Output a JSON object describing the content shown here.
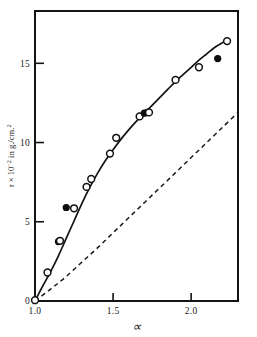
{
  "chart_data": {
    "type": "line",
    "title": "",
    "xlabel": "∝",
    "ylabel": "τ × 10⁻² in g./cm.²",
    "ylabel_parts": {
      "symbol": "τ",
      "times": "×",
      "base": "10",
      "exponent": "-2",
      "units": "in g./cm.",
      "units_exponent": "2"
    },
    "xlim": [
      1.0,
      2.3
    ],
    "ylim": [
      0,
      18.3
    ],
    "grid": false,
    "legend": "none",
    "xticks": [
      1.0,
      1.5,
      2.0
    ],
    "xticklabels": [
      "1.0",
      "1.5",
      "2.0"
    ],
    "yticks": [
      0,
      5,
      10,
      15
    ],
    "yticklabels": [
      "0",
      "5",
      "10",
      "15"
    ],
    "series": [
      {
        "name": "experimental-curve",
        "style": "solid",
        "x": [
          1.0,
          1.05,
          1.1,
          1.15,
          1.2,
          1.25,
          1.3,
          1.35,
          1.4,
          1.45,
          1.5,
          1.55,
          1.6,
          1.65,
          1.7,
          1.75,
          1.8,
          1.85,
          1.9,
          1.95,
          2.0,
          2.05,
          2.1,
          2.15,
          2.2,
          2.23
        ],
        "y": [
          0.0,
          0.95,
          1.85,
          2.85,
          3.95,
          5.05,
          6.15,
          7.15,
          8.05,
          8.85,
          9.55,
          10.2,
          10.8,
          11.35,
          11.85,
          12.35,
          12.85,
          13.35,
          13.85,
          14.3,
          14.75,
          15.2,
          15.6,
          16.0,
          16.3,
          16.45
        ]
      },
      {
        "name": "theoretical-curve",
        "style": "dashed",
        "x": [
          1.0,
          1.1,
          1.2,
          1.3,
          1.4,
          1.5,
          1.6,
          1.7,
          1.8,
          1.9,
          2.0,
          2.1,
          2.2,
          2.3
        ],
        "y": [
          0.0,
          0.75,
          1.55,
          2.45,
          3.35,
          4.3,
          5.25,
          6.2,
          7.15,
          8.1,
          9.05,
          10.0,
          10.95,
          11.9
        ]
      }
    ],
    "points": [
      {
        "x": 1.0,
        "y": 0.05,
        "marker": "open"
      },
      {
        "x": 1.08,
        "y": 1.8,
        "marker": "open"
      },
      {
        "x": 1.15,
        "y": 3.75,
        "marker": "filled"
      },
      {
        "x": 1.16,
        "y": 3.8,
        "marker": "open"
      },
      {
        "x": 1.2,
        "y": 5.9,
        "marker": "filled"
      },
      {
        "x": 1.25,
        "y": 5.85,
        "marker": "open"
      },
      {
        "x": 1.33,
        "y": 7.2,
        "marker": "open"
      },
      {
        "x": 1.36,
        "y": 7.7,
        "marker": "open"
      },
      {
        "x": 1.48,
        "y": 9.3,
        "marker": "open"
      },
      {
        "x": 1.52,
        "y": 10.3,
        "marker": "open"
      },
      {
        "x": 1.67,
        "y": 11.65,
        "marker": "open"
      },
      {
        "x": 1.7,
        "y": 11.85,
        "marker": "filled"
      },
      {
        "x": 1.72,
        "y": 11.9,
        "marker": "filled"
      },
      {
        "x": 1.73,
        "y": 11.9,
        "marker": "open"
      },
      {
        "x": 1.9,
        "y": 13.95,
        "marker": "open"
      },
      {
        "x": 2.05,
        "y": 14.75,
        "marker": "open"
      },
      {
        "x": 2.17,
        "y": 15.3,
        "marker": "filled"
      },
      {
        "x": 2.23,
        "y": 16.4,
        "marker": "open"
      }
    ]
  }
}
